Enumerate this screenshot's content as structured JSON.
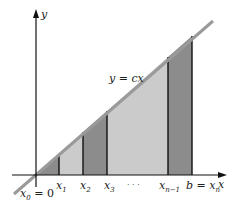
{
  "diagram": {
    "axes": {
      "x_label": "x",
      "y_label": "y"
    },
    "curve": {
      "label": "y = cx",
      "label_lhs": "y",
      "label_eq": " = ",
      "label_rhs": "cx"
    },
    "x_ticks": [
      {
        "base": "x",
        "sub": "0",
        "suffix": " = 0"
      },
      {
        "base": "x",
        "sub": "1"
      },
      {
        "base": "x",
        "sub": "2"
      },
      {
        "base": "x",
        "sub": "3"
      },
      {
        "base": "x",
        "sub": "n−1"
      },
      {
        "prefix": "b = ",
        "base": "x",
        "sub": "n"
      }
    ],
    "ellipsis": "· · ·",
    "colors": {
      "dark_strip": "#8c8c8c",
      "light_strip": "#cbcbcb",
      "line": "#9a9a9a",
      "axis": "#111111"
    }
  }
}
